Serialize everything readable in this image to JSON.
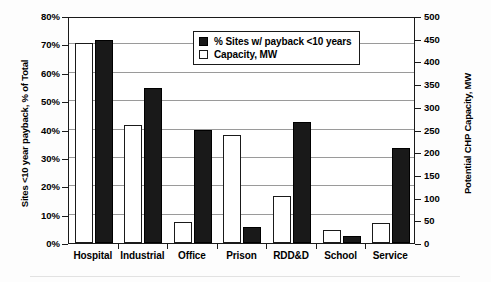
{
  "chart_data": {
    "type": "bar",
    "title": "",
    "subtitle": "",
    "categories": [
      "Hospital",
      "Industrial",
      "Office",
      "Prison",
      "RDD&D",
      "School",
      "Service"
    ],
    "series": [
      {
        "name": "% Sites w/ payback <10 years",
        "axis": "left",
        "unit": "%",
        "style": "filled-black",
        "values": [
          71.5,
          54.5,
          40.0,
          5.5,
          42.5,
          2.5,
          33.5
        ]
      },
      {
        "name": "Capacity, MW",
        "axis": "right",
        "unit": "MW",
        "style": "open-white",
        "values": [
          440,
          260,
          47,
          237,
          103,
          28,
          44
        ]
      }
    ],
    "left_axis": {
      "label": "Sites <10 year payback, % of Total",
      "ticks": [
        "0%",
        "10%",
        "20%",
        "30%",
        "40%",
        "50%",
        "60%",
        "70%",
        "80%"
      ],
      "min": 0,
      "max": 80,
      "step": 10
    },
    "right_axis": {
      "label": "Potential CHP Capacity, MW",
      "ticks": [
        "0",
        "50",
        "100",
        "150",
        "200",
        "250",
        "300",
        "350",
        "400",
        "450",
        "500"
      ],
      "min": 0,
      "max": 500,
      "step": 50
    },
    "xlabel": "",
    "grid": true,
    "legend_position": "top-center",
    "colors": {
      "series_1": "#191919",
      "series_2": "#ffffff",
      "axis": "#1a1a1a",
      "grid": "#9a9a9a",
      "background": "#ffffff"
    }
  },
  "legend": {
    "items": [
      {
        "label": "% Sites w/ payback <10 years",
        "swatch": "dark"
      },
      {
        "label": "Capacity, MW",
        "swatch": "light"
      }
    ]
  }
}
